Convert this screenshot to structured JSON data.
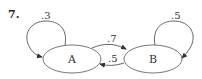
{
  "problem": {
    "number": "7."
  },
  "nodes": [
    {
      "id": "A",
      "label": "A"
    },
    {
      "id": "B",
      "label": "B"
    }
  ],
  "edges": [
    {
      "from": "A",
      "to": "A",
      "label": ".3"
    },
    {
      "from": "A",
      "to": "B",
      "label": ".7"
    },
    {
      "from": "B",
      "to": "A",
      "label": ".5"
    },
    {
      "from": "B",
      "to": "B",
      "label": ".5"
    }
  ]
}
